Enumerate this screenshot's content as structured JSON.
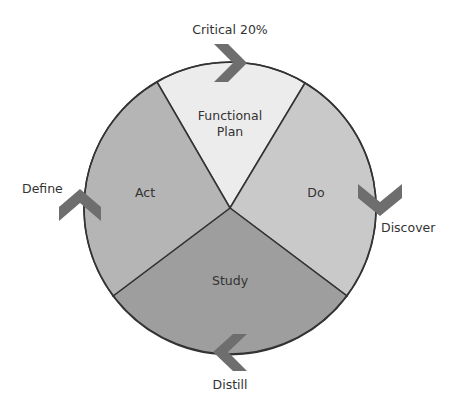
{
  "diagram": {
    "type": "cycle",
    "segments": [
      {
        "id": "functional-plan",
        "label_line1": "Functional",
        "label_line2": "Plan",
        "color": "#ececec"
      },
      {
        "id": "do",
        "label": "Do",
        "color": "#c9c9c9"
      },
      {
        "id": "study",
        "label": "Study",
        "color": "#9e9e9e"
      },
      {
        "id": "act",
        "label": "Act",
        "color": "#b5b5b5"
      }
    ],
    "stages": [
      {
        "id": "critical",
        "label": "Critical 20%",
        "position": "top",
        "arrow_direction": "right"
      },
      {
        "id": "discover",
        "label": "Discover",
        "position": "right",
        "arrow_direction": "down"
      },
      {
        "id": "distill",
        "label": "Distill",
        "position": "bottom",
        "arrow_direction": "left"
      },
      {
        "id": "define",
        "label": "Define",
        "position": "left",
        "arrow_direction": "up"
      }
    ],
    "colors": {
      "outline": "#333333",
      "arrow": "#6e6e6e",
      "text": "#333333"
    }
  }
}
